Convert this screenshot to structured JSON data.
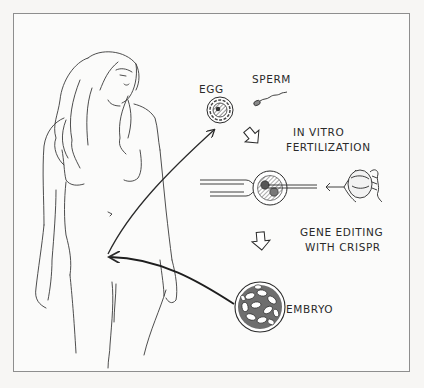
{
  "figure": {
    "labels": {
      "egg": "EGG",
      "sperm": "SPERM",
      "ivf_line1": "IN VITRO",
      "ivf_line2": "FERTILIZATION",
      "gene_line1": "GENE EDITING",
      "gene_line2": "WITH CRISPR",
      "embryo": "EMBRYO"
    },
    "steps": [
      {
        "name": "egg",
        "label": "EGG"
      },
      {
        "name": "sperm",
        "label": "SPERM"
      },
      {
        "name": "in-vitro-fertilization",
        "label": "IN VITRO FERTILIZATION"
      },
      {
        "name": "gene-editing",
        "label": "GENE EDITING WITH CRISPR"
      },
      {
        "name": "embryo",
        "label": "EMBRYO"
      }
    ],
    "colors": {
      "ink": "#2a2a2a",
      "paper": "#fbfbfa",
      "frame": "#8e8e8e"
    }
  }
}
